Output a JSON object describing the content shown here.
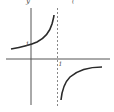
{
  "figure": {
    "axis_labels": {
      "y": "y",
      "top_fragment": "("
    },
    "tick_labels": {
      "x_one": "1",
      "y_one": "1"
    },
    "colors": {
      "curve": "#2a2a2a",
      "axis": "#555555",
      "asymptote": "#888888",
      "background": "#ffffff"
    }
  }
}
